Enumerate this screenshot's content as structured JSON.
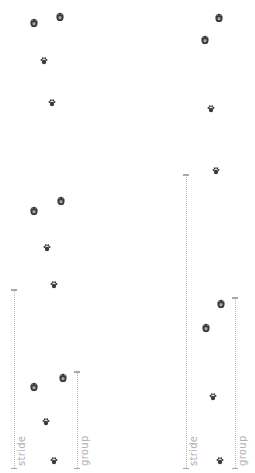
{
  "diagram": {
    "colors": {
      "print": "#3a3a3a",
      "measure": "#b8b8b8",
      "label": "#b0b0b0",
      "background": "#ffffff"
    },
    "left_trackway": {
      "prints": [
        {
          "x": 34,
          "y": 22,
          "size": "large"
        },
        {
          "x": 60,
          "y": 16,
          "size": "large"
        },
        {
          "x": 44,
          "y": 61,
          "size": "small"
        },
        {
          "x": 52,
          "y": 103,
          "size": "small"
        },
        {
          "x": 34,
          "y": 210,
          "size": "large"
        },
        {
          "x": 61,
          "y": 200,
          "size": "large"
        },
        {
          "x": 47,
          "y": 248,
          "size": "small"
        },
        {
          "x": 54,
          "y": 285,
          "size": "small"
        },
        {
          "x": 34,
          "y": 386,
          "size": "large"
        },
        {
          "x": 63,
          "y": 377,
          "size": "large"
        },
        {
          "x": 46,
          "y": 422,
          "size": "small"
        },
        {
          "x": 54,
          "y": 461,
          "size": "small"
        }
      ],
      "stride_label": "stride",
      "group_label": "group"
    },
    "right_trackway": {
      "prints": [
        {
          "x": 219,
          "y": 17,
          "size": "large"
        },
        {
          "x": 205,
          "y": 39,
          "size": "large"
        },
        {
          "x": 211,
          "y": 109,
          "size": "small"
        },
        {
          "x": 216,
          "y": 171,
          "size": "small"
        },
        {
          "x": 221,
          "y": 303,
          "size": "large"
        },
        {
          "x": 206,
          "y": 327,
          "size": "large"
        },
        {
          "x": 213,
          "y": 397,
          "size": "small"
        },
        {
          "x": 220,
          "y": 461,
          "size": "small"
        }
      ],
      "stride_label": "stride",
      "group_label": "group"
    }
  }
}
